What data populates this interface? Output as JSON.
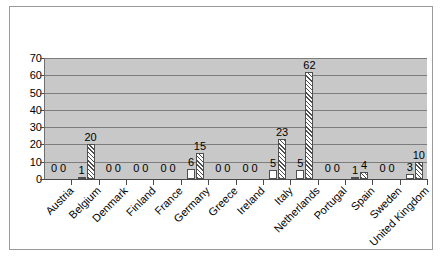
{
  "chart_data": {
    "type": "bar",
    "title": "",
    "subtitle": "",
    "xlabel": "",
    "ylabel": "",
    "ylim": [
      0,
      70
    ],
    "yticks": [
      0,
      10,
      20,
      30,
      40,
      50,
      60,
      70
    ],
    "grid": "horizontal",
    "legend": "none",
    "orientation": "vertical",
    "label_rotation": "-45",
    "value_labels": true,
    "categories": [
      "Austria",
      "Belgium",
      "Denmark",
      "Finland",
      "France",
      "Germany",
      "Greece",
      "Ireland",
      "Italy",
      "Netherlands",
      "Portugal",
      "Spain",
      "Sweden",
      "United Kingdom"
    ],
    "series": [
      {
        "name": "Series 1",
        "style": "solid-white",
        "values": [
          0,
          1,
          0,
          0,
          0,
          6,
          0,
          0,
          5,
          5,
          0,
          1,
          0,
          3
        ]
      },
      {
        "name": "Series 2",
        "style": "diagonal-hatch",
        "values": [
          0,
          20,
          0,
          0,
          0,
          15,
          0,
          0,
          23,
          62,
          0,
          4,
          0,
          10
        ]
      }
    ],
    "colors": {
      "plot_background": "#c8c8c8",
      "gridline": "#7d7d7d",
      "axis": "#4a4a4a",
      "bar_series1": "#ffffff",
      "bar_series2_hatch": "#4f4f4f",
      "bar_outline": "#4f4f4f",
      "figure_border": "#9a9a9a",
      "text": "#000000"
    }
  }
}
